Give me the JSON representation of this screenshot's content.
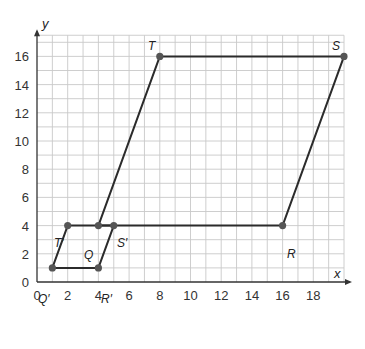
{
  "chart_data": {
    "type": "line",
    "title": "",
    "xlabel": "x",
    "ylabel": "y",
    "xlim": [
      0,
      20
    ],
    "ylim": [
      0,
      17.5
    ],
    "grid": true,
    "x_ticks": [
      0,
      2,
      4,
      6,
      8,
      10,
      12,
      14,
      16,
      18
    ],
    "y_ticks": [
      0,
      2,
      4,
      6,
      8,
      10,
      12,
      14,
      16
    ],
    "series": [
      {
        "name": "QRST",
        "closed": true,
        "points": [
          {
            "label": "Q",
            "x": 4,
            "y": 4
          },
          {
            "label": "R",
            "x": 16,
            "y": 4
          },
          {
            "label": "S",
            "x": 20,
            "y": 16
          },
          {
            "label": "T",
            "x": 8,
            "y": 16
          }
        ]
      },
      {
        "name": "Q'R'S'T'",
        "closed": true,
        "points": [
          {
            "label": "Q'",
            "x": 1,
            "y": 1
          },
          {
            "label": "R'",
            "x": 4,
            "y": 1
          },
          {
            "label": "S'",
            "x": 5,
            "y": 4
          },
          {
            "label": "T'",
            "x": 2,
            "y": 4
          }
        ]
      }
    ]
  },
  "layout": {
    "origin_px": [
      37,
      282
    ],
    "px_per_x": 15.35,
    "px_per_y": 14.1,
    "grid_color": "#c8c8c8",
    "line_color": "#2b2b2b",
    "point_color": "#555555"
  },
  "labels": {
    "x_axis": "x",
    "y_axis": "y",
    "Q": "Q",
    "R": "R",
    "S": "S",
    "T": "T",
    "Q_prime": "Q′",
    "R_prime": "R′",
    "S_prime": "S′",
    "T_prime": "T′"
  }
}
